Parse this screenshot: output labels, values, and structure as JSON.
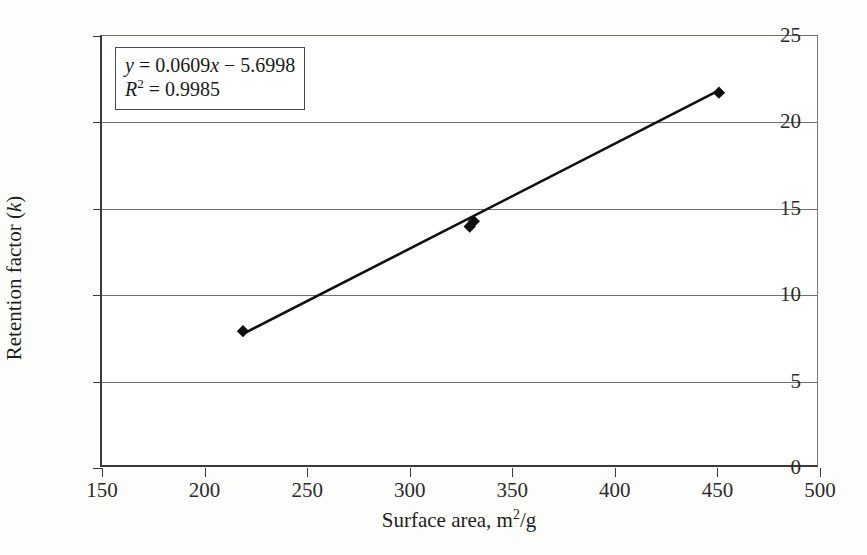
{
  "chart_data": {
    "type": "scatter",
    "title": "",
    "xlabel": "Surface area, m²/g",
    "ylabel": "Retention factor (k)",
    "xlim": [
      150,
      500
    ],
    "ylim": [
      0,
      25
    ],
    "xticks": [
      150,
      200,
      250,
      300,
      350,
      400,
      450,
      500
    ],
    "yticks": [
      0,
      5,
      10,
      15,
      20,
      25
    ],
    "grid": "horizontal",
    "gridline_values": [
      5,
      10,
      15,
      20
    ],
    "legend": "none",
    "marker": "filled-diamond",
    "marker_color": "#101010",
    "line_color": "#101010",
    "points": [
      {
        "x": 219,
        "y": 7.8
      },
      {
        "x": 330,
        "y": 13.9
      },
      {
        "x": 332,
        "y": 14.2
      },
      {
        "x": 452,
        "y": 21.7
      }
    ],
    "series": [
      {
        "name": "Retention factor vs surface area",
        "x": [
          219,
          330,
          332,
          452
        ],
        "values": [
          7.8,
          13.9,
          14.2,
          21.7
        ]
      }
    ],
    "trendline": {
      "type": "linear",
      "slope": 0.0609,
      "intercept": -5.6998,
      "r_squared": 0.9985,
      "x_start": 219,
      "x_end": 452
    },
    "annotations": {
      "equation_line1_y": "y",
      "equation_line1_rest": " = 0.0609",
      "equation_line1_x": "x",
      "equation_line1_tail": " − 5.6998",
      "equation_line2_r": "R",
      "equation_line2_exp": "2",
      "equation_line2_tail": " = 0.9985"
    }
  },
  "axes": {
    "y_title_main": "Retention factor (",
    "y_title_italic": "k",
    "y_title_close": ")",
    "x_title_main": "Surface area, m",
    "x_title_exp": "2",
    "x_title_tail": "/g"
  }
}
